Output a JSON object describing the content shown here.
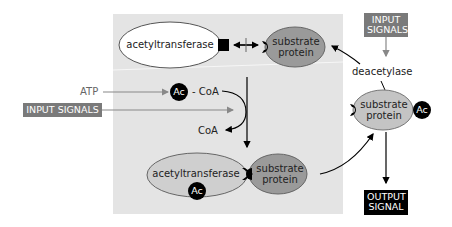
{
  "diagram": {
    "top_enzyme": {
      "label": "acetyltransferase"
    },
    "top_substrate": {
      "label_line1": "substrate",
      "label_line2": "protein"
    },
    "input_signals_top": {
      "line1": "INPUT",
      "line2": "SIGNALS"
    },
    "deacetylase": {
      "label": "deacetylase"
    },
    "right_substrate": {
      "label_line1": "substrate",
      "label_line2": "protein",
      "ac": "Ac"
    },
    "atp": {
      "label": "ATP"
    },
    "acetyl_coa": {
      "ac": "Ac",
      "coa": "- CoA"
    },
    "input_signals_left": {
      "label": "INPUT SIGNALS"
    },
    "coa_out": {
      "label": "CoA"
    },
    "bottom_enzyme": {
      "label": "acetyltransferase",
      "ac": "Ac"
    },
    "bottom_substrate": {
      "label_line1": "substrate",
      "label_line2": "protein"
    },
    "output_signal": {
      "line1": "OUTPUT",
      "line2": "SIGNAL"
    },
    "colors": {
      "panel": "#e4e4e4",
      "substrate": "#9a9a9a",
      "enzyme_bottom": "#cfcfcf",
      "grey_box": "#7a7a7a",
      "black": "#000000"
    }
  }
}
